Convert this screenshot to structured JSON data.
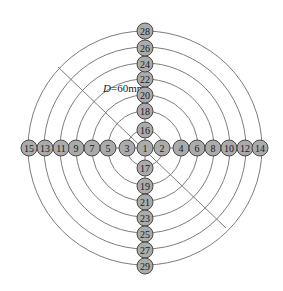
{
  "diagram": {
    "center": {
      "x": 145,
      "y": 148
    },
    "ring_radii": [
      18,
      37,
      53,
      69,
      85,
      101,
      117
    ],
    "diameter_label": {
      "var": "D",
      "rest": "=60mm",
      "x": 103,
      "y": 92
    },
    "diagonal": {
      "x1": 58,
      "y1": 67,
      "x2": 226,
      "y2": 228
    },
    "node_radius": 8,
    "nodes": [
      {
        "label": "1",
        "x": 145,
        "y": 148
      },
      {
        "label": "2",
        "x": 162,
        "y": 148
      },
      {
        "label": "3",
        "x": 127,
        "y": 148
      },
      {
        "label": "4",
        "x": 181,
        "y": 148
      },
      {
        "label": "5",
        "x": 108,
        "y": 148
      },
      {
        "label": "6",
        "x": 197,
        "y": 148
      },
      {
        "label": "7",
        "x": 92,
        "y": 148
      },
      {
        "label": "8",
        "x": 213,
        "y": 148
      },
      {
        "label": "9",
        "x": 76,
        "y": 148
      },
      {
        "label": "10",
        "x": 229,
        "y": 148
      },
      {
        "label": "11",
        "x": 61,
        "y": 148
      },
      {
        "label": "12",
        "x": 245,
        "y": 148
      },
      {
        "label": "13",
        "x": 45,
        "y": 148
      },
      {
        "label": "14",
        "x": 260,
        "y": 148
      },
      {
        "label": "15",
        "x": 29,
        "y": 148
      },
      {
        "label": "16",
        "x": 145,
        "y": 130
      },
      {
        "label": "17",
        "x": 145,
        "y": 168
      },
      {
        "label": "18",
        "x": 145,
        "y": 111
      },
      {
        "label": "19",
        "x": 145,
        "y": 186
      },
      {
        "label": "20",
        "x": 145,
        "y": 95
      },
      {
        "label": "21",
        "x": 145,
        "y": 202
      },
      {
        "label": "22",
        "x": 145,
        "y": 79
      },
      {
        "label": "23",
        "x": 145,
        "y": 218
      },
      {
        "label": "24",
        "x": 145,
        "y": 64
      },
      {
        "label": "25",
        "x": 145,
        "y": 234
      },
      {
        "label": "26",
        "x": 145,
        "y": 48
      },
      {
        "label": "27",
        "x": 145,
        "y": 250
      },
      {
        "label": "28",
        "x": 145,
        "y": 31
      },
      {
        "label": "29",
        "x": 145,
        "y": 266
      }
    ]
  }
}
